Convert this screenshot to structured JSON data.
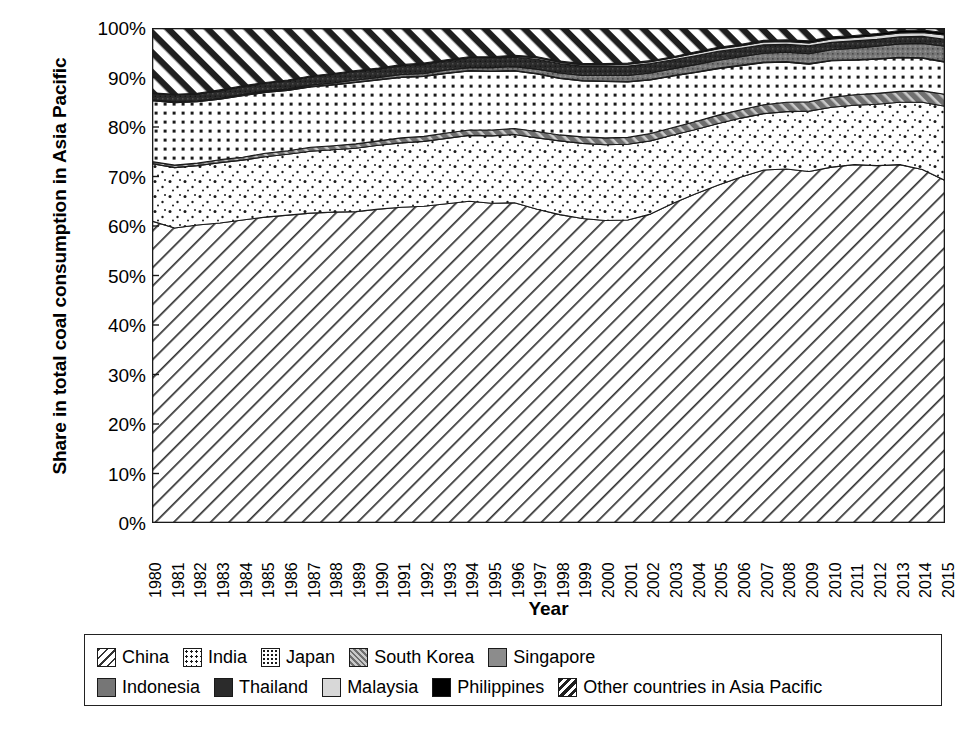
{
  "chart_data": {
    "type": "area",
    "title": "",
    "xlabel": "Year",
    "ylabel": "Share in total coal consumption in Asia Pacific",
    "ylim": [
      0,
      100
    ],
    "ytick_labels": [
      "0%",
      "10%",
      "20%",
      "30%",
      "40%",
      "50%",
      "60%",
      "70%",
      "80%",
      "90%",
      "100%"
    ],
    "ytick_values": [
      0,
      10,
      20,
      30,
      40,
      50,
      60,
      70,
      80,
      90,
      100
    ],
    "grid": false,
    "stacked": true,
    "normalized_percent": true,
    "legend_position": "bottom",
    "x": [
      1980,
      1981,
      1982,
      1983,
      1984,
      1985,
      1986,
      1987,
      1988,
      1989,
      1990,
      1991,
      1992,
      1993,
      1994,
      1995,
      1996,
      1997,
      1998,
      1999,
      2000,
      2001,
      2002,
      2003,
      2004,
      2005,
      2006,
      2007,
      2008,
      2009,
      2010,
      2011,
      2012,
      2013,
      2014,
      2015
    ],
    "categories": [
      "1980",
      "1981",
      "1982",
      "1983",
      "1984",
      "1985",
      "1986",
      "1987",
      "1988",
      "1989",
      "1990",
      "1991",
      "1992",
      "1993",
      "1994",
      "1995",
      "1996",
      "1997",
      "1998",
      "1999",
      "2000",
      "2001",
      "2002",
      "2003",
      "2004",
      "2005",
      "2006",
      "2007",
      "2008",
      "2009",
      "2010",
      "2011",
      "2012",
      "2013",
      "2014",
      "2015"
    ],
    "series": [
      {
        "name": "China",
        "pattern": "diagonal-lines",
        "values": [
          61.0,
          59.6,
          60.2,
          60.6,
          61.2,
          61.8,
          62.2,
          62.6,
          62.8,
          62.9,
          63.4,
          63.8,
          64.0,
          64.5,
          65.0,
          64.6,
          64.7,
          63.4,
          62.3,
          61.5,
          61.1,
          61.2,
          62.4,
          64.6,
          66.5,
          68.3,
          69.9,
          71.3,
          71.5,
          71.0,
          71.9,
          72.4,
          72.2,
          72.4,
          71.4,
          69.2
        ]
      },
      {
        "name": "India",
        "pattern": "sparse-dots",
        "values": [
          11.6,
          12.2,
          12.0,
          12.2,
          12.1,
          12.2,
          12.3,
          12.5,
          12.6,
          12.8,
          12.9,
          13.0,
          13.1,
          13.2,
          13.3,
          13.6,
          13.8,
          14.4,
          14.9,
          15.2,
          15.3,
          15.3,
          14.8,
          13.8,
          13.0,
          12.4,
          11.9,
          11.4,
          11.6,
          12.2,
          12.1,
          12.0,
          12.4,
          12.6,
          13.6,
          15.0
        ]
      },
      {
        "name": "South Korea",
        "pattern": "light-diagonal",
        "values": [
          0.4,
          0.5,
          0.5,
          0.6,
          0.6,
          0.7,
          0.7,
          0.8,
          0.8,
          0.9,
          0.9,
          1.0,
          1.0,
          1.1,
          1.1,
          1.2,
          1.2,
          1.3,
          1.2,
          1.3,
          1.4,
          1.4,
          1.5,
          1.5,
          1.6,
          1.7,
          1.7,
          1.8,
          1.9,
          1.9,
          2.0,
          2.1,
          2.2,
          2.2,
          2.3,
          2.4
        ]
      },
      {
        "name": "Japan",
        "pattern": "dot-grid",
        "values": [
          12.3,
          12.6,
          12.4,
          12.2,
          12.4,
          12.3,
          12.2,
          12.2,
          12.3,
          12.4,
          12.3,
          12.2,
          12.1,
          12.0,
          11.9,
          11.8,
          11.6,
          11.6,
          11.4,
          11.3,
          11.4,
          11.2,
          10.8,
          10.4,
          9.9,
          9.4,
          8.9,
          8.5,
          8.1,
          7.6,
          7.4,
          7.0,
          6.9,
          6.8,
          6.6,
          6.5
        ]
      },
      {
        "name": "Singapore",
        "pattern": "gray-solid",
        "values": [
          0.1,
          0.1,
          0.1,
          0.1,
          0.1,
          0.1,
          0.1,
          0.1,
          0.1,
          0.1,
          0.1,
          0.1,
          0.1,
          0.1,
          0.1,
          0.1,
          0.1,
          0.1,
          0.1,
          0.1,
          0.1,
          0.1,
          0.1,
          0.1,
          0.1,
          0.1,
          0.1,
          0.1,
          0.1,
          0.1,
          0.1,
          0.1,
          0.1,
          0.1,
          0.1,
          0.1
        ]
      },
      {
        "name": "Indonesia",
        "pattern": "mid-gray-texture",
        "values": [
          0.1,
          0.1,
          0.1,
          0.1,
          0.2,
          0.2,
          0.2,
          0.3,
          0.3,
          0.4,
          0.4,
          0.5,
          0.5,
          0.6,
          0.6,
          0.7,
          0.8,
          0.9,
          1.0,
          1.0,
          1.1,
          1.2,
          1.3,
          1.4,
          1.5,
          1.6,
          1.7,
          1.8,
          1.9,
          2.0,
          2.1,
          2.3,
          2.5,
          2.7,
          2.9,
          3.1
        ]
      },
      {
        "name": "Thailand",
        "pattern": "dark-texture",
        "values": [
          1.3,
          1.4,
          1.4,
          1.5,
          1.5,
          1.5,
          1.6,
          1.6,
          1.7,
          1.7,
          1.7,
          1.8,
          1.8,
          1.8,
          1.9,
          1.9,
          1.9,
          2.0,
          1.9,
          1.9,
          1.9,
          1.9,
          1.9,
          1.8,
          1.8,
          1.8,
          1.7,
          1.7,
          1.6,
          1.6,
          1.5,
          1.5,
          1.4,
          1.4,
          1.4,
          1.4
        ]
      },
      {
        "name": "Malaysia",
        "pattern": "light-gray-solid",
        "values": [
          0.0,
          0.0,
          0.0,
          0.1,
          0.1,
          0.1,
          0.1,
          0.1,
          0.1,
          0.1,
          0.1,
          0.1,
          0.2,
          0.2,
          0.2,
          0.2,
          0.2,
          0.3,
          0.3,
          0.3,
          0.3,
          0.4,
          0.4,
          0.4,
          0.5,
          0.5,
          0.5,
          0.6,
          0.6,
          0.6,
          0.7,
          0.7,
          0.8,
          0.8,
          0.8,
          0.9
        ]
      },
      {
        "name": "Philippines",
        "pattern": "black-solid",
        "values": [
          0.1,
          0.1,
          0.1,
          0.1,
          0.1,
          0.1,
          0.1,
          0.1,
          0.1,
          0.1,
          0.1,
          0.1,
          0.1,
          0.1,
          0.1,
          0.1,
          0.2,
          0.2,
          0.2,
          0.2,
          0.2,
          0.2,
          0.2,
          0.2,
          0.3,
          0.3,
          0.3,
          0.3,
          0.3,
          0.4,
          0.4,
          0.4,
          0.4,
          0.5,
          0.5,
          0.5
        ]
      },
      {
        "name": "Other countries in Asia Pacific",
        "pattern": "steep-diagonal",
        "values": [
          13.1,
          13.4,
          13.2,
          12.5,
          11.7,
          11.0,
          10.5,
          9.7,
          9.2,
          8.6,
          8.1,
          7.3,
          7.1,
          6.5,
          5.9,
          5.9,
          5.5,
          5.8,
          6.7,
          7.2,
          7.2,
          7.1,
          6.6,
          5.8,
          4.8,
          3.9,
          3.2,
          2.5,
          2.3,
          2.6,
          1.8,
          1.5,
          1.1,
          0.5,
          0.4,
          1.0
        ]
      }
    ]
  },
  "legend": {
    "rows": [
      [
        {
          "label": "China",
          "pattern": "diagonal-lines"
        },
        {
          "label": "India",
          "pattern": "sparse-dots"
        },
        {
          "label": "Japan",
          "pattern": "dot-grid"
        },
        {
          "label": "South Korea",
          "pattern": "light-diagonal"
        },
        {
          "label": "Singapore",
          "pattern": "gray-solid"
        }
      ],
      [
        {
          "label": "Indonesia",
          "pattern": "mid-gray-texture"
        },
        {
          "label": "Thailand",
          "pattern": "dark-texture"
        },
        {
          "label": "Malaysia",
          "pattern": "light-gray-solid"
        },
        {
          "label": "Philippines",
          "pattern": "black-solid"
        },
        {
          "label": "Other countries in Asia Pacific",
          "pattern": "steep-diagonal"
        }
      ]
    ]
  },
  "colors": {
    "ink": "#1a1a1a",
    "background": "#ffffff",
    "gray_solid": "#8c8c8c",
    "mid_gray": "#767676",
    "dark_texture": "#2b2b2b",
    "light_gray": "#d8d8d8",
    "black": "#000000"
  }
}
